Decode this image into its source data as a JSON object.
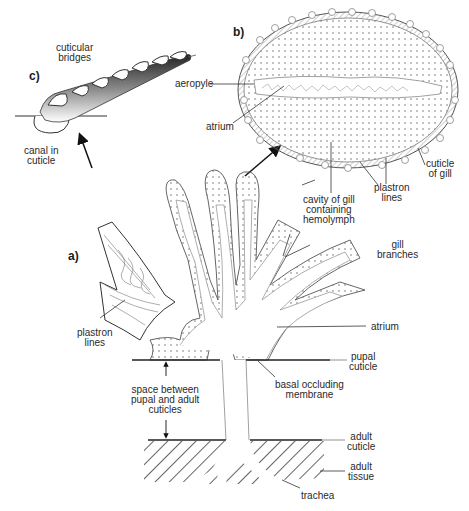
{
  "panels": {
    "a": "a)",
    "b": "b)",
    "c": "c)"
  },
  "labels": {
    "cuticular_bridges": "cuticular\nbridges",
    "canal_in_cuticle": "canal in\ncuticle",
    "aeropyle": "aeropyle",
    "atrium_b": "atrium",
    "cuticle_of_gill": "cuticle\nof gill",
    "plastron_lines_b": "plastron\nlines",
    "cavity_of_gill": "cavity of gill\ncontaining\nhemolymph",
    "gill_branches": "gill\nbranches",
    "plastron_lines_a": "plastron\nlines",
    "atrium_a": "atrium",
    "pupal_cuticle": "pupal\ncuticle",
    "basal_occluding_membrane": "basal occluding\nmembrane",
    "space_between": "space between\npupal and adult\ncuticles",
    "adult_cuticle": "adult\ncuticle",
    "adult_tissue": "adult\ntissue",
    "trachea": "trachea"
  }
}
